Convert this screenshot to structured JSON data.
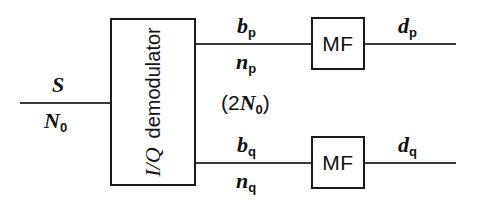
{
  "diagram": {
    "background": "#ffffff",
    "line_color": "#3a3a3a",
    "box_border_color": "#1a1a1a",
    "text_color": "#111111"
  },
  "blocks": {
    "demodulator": {
      "name": "I/Q demodulator",
      "label_italic_part": "I/Q",
      "label_upright_part": "demodulator",
      "orientation": "vertical-bottom-to-top"
    },
    "matched_filter_top": {
      "label": "MF"
    },
    "matched_filter_bottom": {
      "label": "MF"
    }
  },
  "labels": {
    "input_signal": {
      "symbol": "S",
      "subscript": ""
    },
    "input_noise": {
      "symbol": "N",
      "subscript": "0"
    },
    "branch_p_signal": {
      "symbol": "b",
      "subscript": "p"
    },
    "branch_p_noise": {
      "symbol": "n",
      "subscript": "p"
    },
    "branch_q_signal": {
      "symbol": "b",
      "subscript": "q"
    },
    "branch_q_noise": {
      "symbol": "n",
      "subscript": "q"
    },
    "noise_density": {
      "open": "(",
      "factor": "2",
      "symbol": "N",
      "subscript": "0",
      "close": ")"
    },
    "output_p": {
      "symbol": "d",
      "subscript": "p"
    },
    "output_q": {
      "symbol": "d",
      "subscript": "q"
    }
  }
}
